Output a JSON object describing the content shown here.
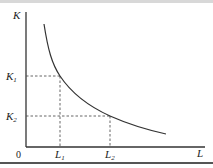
{
  "diagram": {
    "y_axis": {
      "label": "K"
    },
    "x_axis": {
      "label": "L"
    },
    "origin_label": "0",
    "y_ticks": [
      {
        "main": "K",
        "sub": "1"
      },
      {
        "main": "K",
        "sub": "2"
      }
    ],
    "x_ticks": [
      {
        "main": "L",
        "sub": "1"
      },
      {
        "main": "L",
        "sub": "2"
      }
    ],
    "colors": {
      "axis": "#333333",
      "curve": "#333333",
      "dashed": "#555555"
    }
  }
}
